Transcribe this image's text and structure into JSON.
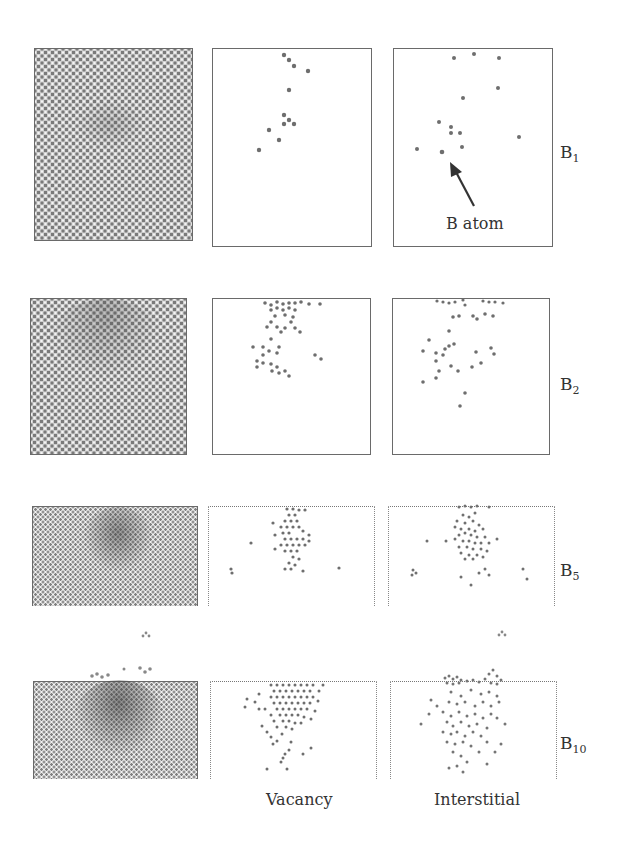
{
  "figure": {
    "rows": [
      {
        "id": "B1",
        "label_main": "B",
        "label_sub": "1"
      },
      {
        "id": "B2",
        "label_main": "B",
        "label_sub": "2"
      },
      {
        "id": "B5",
        "label_main": "B",
        "label_sub": "5"
      },
      {
        "id": "B10",
        "label_main": "B",
        "label_sub": "10"
      }
    ],
    "columns": [
      {
        "id": "lattice",
        "label": ""
      },
      {
        "id": "vacancy",
        "label": "Vacancy"
      },
      {
        "id": "interstitial",
        "label": "Interstitial"
      }
    ],
    "annotation": {
      "text": "B atom",
      "target_row": "B1",
      "target_column": "interstitial",
      "icon": "arrow-icon"
    },
    "colors": {
      "atom": "#7a7a7a",
      "defect": "#6e6e6e",
      "frame": "#6a6a6a",
      "background": "#ffffff"
    }
  }
}
